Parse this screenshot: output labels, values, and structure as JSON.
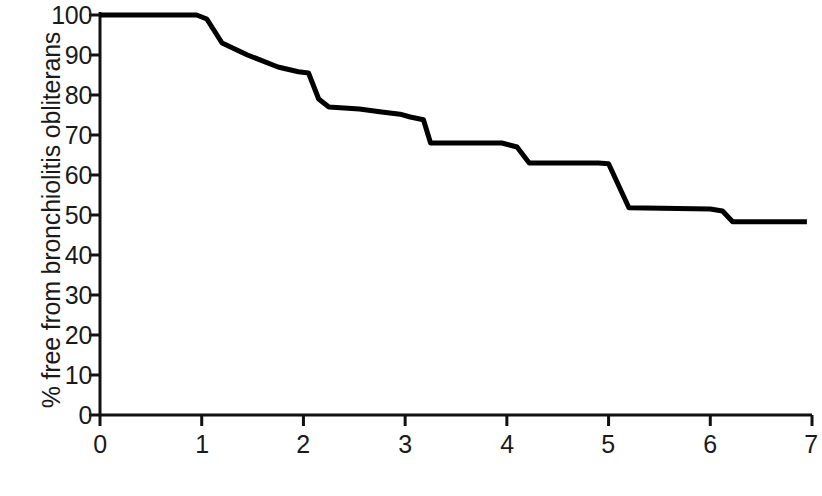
{
  "chart_data": {
    "type": "line",
    "title": "",
    "subtitle": "",
    "xlabel": "Years post transplantation",
    "ylabel": "% free from bronchiolitis obliterans",
    "xlim": [
      0,
      7
    ],
    "ylim": [
      0,
      100
    ],
    "xticks": [
      0,
      1,
      2,
      3,
      4,
      5,
      6,
      7
    ],
    "xtick_labels": [
      "0",
      "1",
      "2",
      "3",
      "4",
      "5",
      "6",
      "7"
    ],
    "yticks": [
      0,
      10,
      20,
      30,
      40,
      50,
      60,
      70,
      80,
      90,
      100
    ],
    "ytick_labels": [
      "0",
      "10",
      "20",
      "30",
      "40",
      "50",
      "60",
      "70",
      "80",
      "90",
      "100"
    ],
    "grid": false,
    "legend": null,
    "legend_position": "none",
    "line_color": "#000000",
    "line_width": 5,
    "series": [
      {
        "name": "Freedom from bronchiolitis obliterans",
        "x": [
          0.0,
          0.95,
          1.05,
          1.2,
          1.45,
          1.75,
          1.95,
          2.05,
          2.15,
          2.25,
          2.55,
          2.75,
          2.95,
          3.05,
          3.18,
          3.25,
          3.95,
          4.1,
          4.22,
          4.9,
          5.0,
          5.2,
          6.0,
          6.12,
          6.22,
          6.95
        ],
        "y": [
          100.0,
          100.0,
          99.0,
          93.0,
          90.0,
          87.0,
          85.8,
          85.5,
          79.0,
          77.0,
          76.5,
          75.8,
          75.2,
          74.5,
          73.8,
          68.0,
          68.0,
          67.0,
          63.0,
          63.0,
          62.8,
          51.8,
          51.5,
          51.0,
          48.3,
          48.3
        ]
      }
    ],
    "annotations": []
  },
  "axis": {
    "y_title": "% free from bronchiolitis obliterans",
    "x_title": "Years post transplantation"
  }
}
